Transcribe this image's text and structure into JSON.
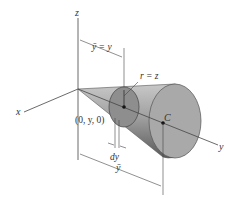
{
  "diagram": {
    "type": "cone-centroid-figure",
    "axes": {
      "x": "x",
      "y": "y",
      "z": "z"
    },
    "labels": {
      "ybar_eq_y": "ȳ = y",
      "r_eq_z": "r = z",
      "point": "(0, y, 0)",
      "dy": "dy",
      "ybar": "ȳ",
      "centroid": "C"
    },
    "colors": {
      "cone_light": "#b5b5b5",
      "cone_dark": "#6e6e6e",
      "base_face": "#a9a9a9",
      "disk_face": "#8e8e8e",
      "line": "#444444",
      "background": "#ffffff"
    }
  }
}
